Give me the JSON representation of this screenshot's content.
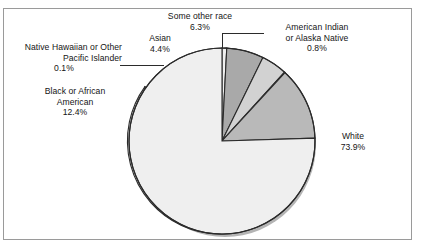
{
  "chart_data": {
    "type": "pie",
    "title": "",
    "subtitle": "",
    "xlabel": "",
    "ylabel": "",
    "legend_position": "callout-labels",
    "grid": false,
    "categories": [
      "White",
      "Black or African American",
      "American Indian or Alaska Native",
      "Asian",
      "Native Hawaiian or Other Pacific Islander",
      "Some other race"
    ],
    "values": [
      73.9,
      12.4,
      0.8,
      4.4,
      0.1,
      6.3
    ],
    "unit": "%",
    "slices": [
      {
        "name": "White",
        "value": 73.9,
        "value_label": "73.9%",
        "color": "#efefef",
        "label_lines": [
          "White",
          "73.9%"
        ]
      },
      {
        "name": "Black or African American",
        "value": 12.4,
        "value_label": "12.4%",
        "color": "#b9b9b9",
        "label_lines": [
          "Black or African",
          "American",
          "12.4%"
        ]
      },
      {
        "name": "Native Hawaiian or Other Pacific Islander",
        "value": 0.1,
        "value_label": "0.1%",
        "color": "#8e8e8e",
        "label_lines": [
          "Native Hawaiian or Other",
          "Pacific Islander",
          "0.1%"
        ]
      },
      {
        "name": "Asian",
        "value": 4.4,
        "value_label": "4.4%",
        "color": "#d2d2d2",
        "label_lines": [
          "Asian",
          "4.4%"
        ]
      },
      {
        "name": "Some other race",
        "value": 6.3,
        "value_label": "6.3%",
        "color": "#a9a9a9",
        "label_lines": [
          "Some other race",
          "6.3%"
        ]
      },
      {
        "name": "American Indian or Alaska Native",
        "value": 0.8,
        "value_label": "0.8%",
        "color": "#efefef",
        "label_lines": [
          "American Indian",
          "or Alaska Native",
          "0.8%"
        ]
      }
    ]
  },
  "labels": {
    "some_other_race": {
      "line1": "Some other race",
      "line2": "6.3%"
    },
    "american_indian": {
      "line1": "American Indian",
      "line2": "or Alaska Native",
      "line3": "0.8%"
    },
    "asian": {
      "line1": "Asian",
      "line2": "4.4%"
    },
    "native_hawaiian": {
      "line1": "Native Hawaiian or Other",
      "line2": "Pacific Islander",
      "line3": "0.1%"
    },
    "black_african_american": {
      "line1": "Black or African",
      "line2": "American",
      "line3": "12.4%"
    },
    "white": {
      "line1": "White",
      "line2": "73.9%"
    }
  },
  "colors": {
    "frame_border": "#9a9a9a",
    "page_background": "#ffffff",
    "slice_outline": "#2b2b2b",
    "pie_shadow": "#b0b0b0",
    "text": "#151515"
  }
}
